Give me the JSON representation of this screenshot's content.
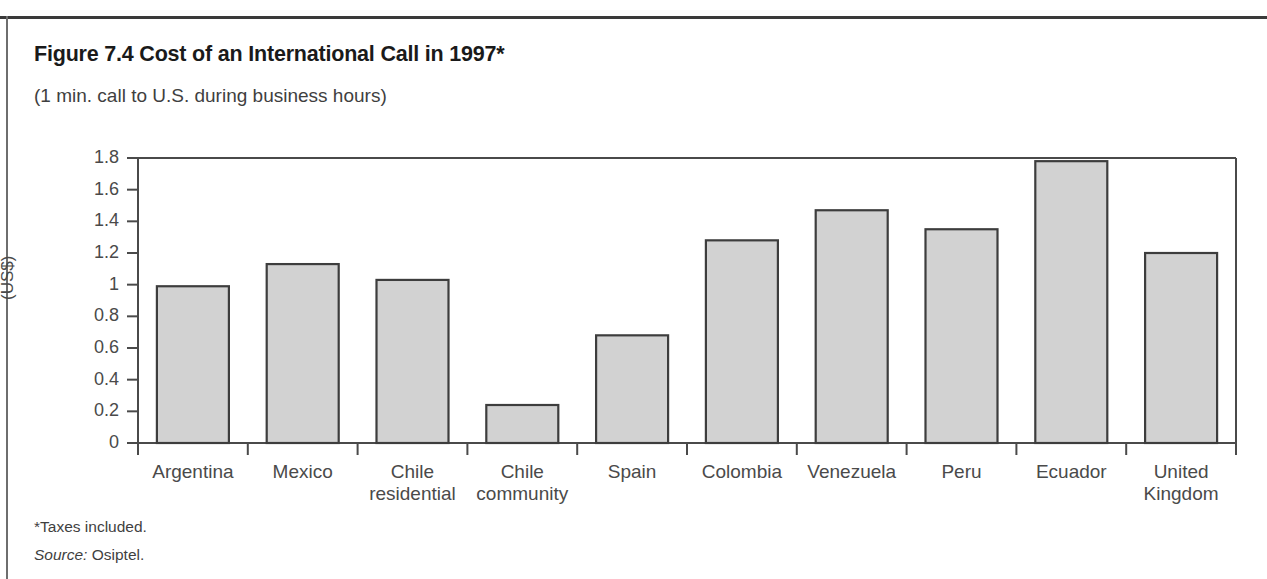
{
  "figure": {
    "title": "Figure 7.4 Cost of an International Call in 1997*",
    "subtitle": "(1 min. call to U.S. during business hours)",
    "footnote_taxes": "*Taxes included.",
    "footnote_source_label": "Source:",
    "footnote_source_value": "Osiptel."
  },
  "colors": {
    "bar_fill": "#d2d2d2",
    "bar_stroke": "#3d3d3d",
    "axis": "#4a4a4a",
    "frame": "#4a4a4a",
    "text": "#3f3f3f",
    "rule": "#3a3a3a"
  },
  "chart_data": {
    "type": "bar",
    "title": "Figure 7.4 Cost of an International Call in 1997*",
    "subtitle": "(1 min. call to U.S. during business hours)",
    "xlabel": "",
    "ylabel": "(US$)",
    "ylim": [
      0,
      1.8
    ],
    "ytick_values": [
      0,
      0.2,
      0.4,
      0.6,
      0.8,
      1,
      1.2,
      1.4,
      1.6,
      1.8
    ],
    "ytick_labels": [
      "0",
      "0.2",
      "0.4",
      "0.6",
      "0.8",
      "1",
      "1.2",
      "1.4",
      "1.6",
      "1.8"
    ],
    "grid": false,
    "legend": false,
    "categories": [
      "Argentina",
      "Mexico",
      "Chile residential",
      "Chile community",
      "Spain",
      "Colombia",
      "Venezuela",
      "Peru",
      "Ecuador",
      "United Kingdom"
    ],
    "category_lines": [
      [
        "Argentina"
      ],
      [
        "Mexico"
      ],
      [
        "Chile",
        "residential"
      ],
      [
        "Chile",
        "community"
      ],
      [
        "Spain"
      ],
      [
        "Colombia"
      ],
      [
        "Venezuela"
      ],
      [
        "Peru"
      ],
      [
        "Ecuador"
      ],
      [
        "United",
        "Kingdom"
      ]
    ],
    "values": [
      0.99,
      1.13,
      1.03,
      0.24,
      0.68,
      1.28,
      1.47,
      1.35,
      1.78,
      1.2
    ]
  }
}
